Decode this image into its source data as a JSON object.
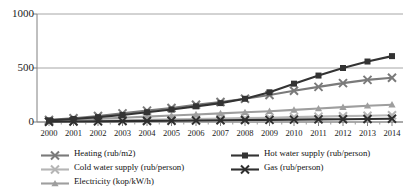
{
  "chart_data": {
    "type": "line",
    "title": "",
    "xlabel": "",
    "ylabel": "",
    "ylim": [
      0,
      1000
    ],
    "yticks": [
      0,
      500,
      1000
    ],
    "grid": true,
    "legend_position": "bottom",
    "categories": [
      "2000",
      "2001",
      "2002",
      "2003",
      "2004",
      "2005",
      "2006",
      "2007",
      "2008",
      "2009",
      "2010",
      "2011",
      "2012",
      "2013",
      "2014"
    ],
    "series": [
      {
        "name": "Heating (rub/m2)",
        "color": "#7a7a7a",
        "marker": "x",
        "values": [
          20,
          35,
          55,
          80,
          105,
          130,
          160,
          185,
          215,
          250,
          290,
          325,
          360,
          390,
          410
        ]
      },
      {
        "name": "Hot water supply (rub/person)",
        "color": "#333333",
        "marker": "square",
        "values": [
          15,
          28,
          45,
          65,
          90,
          115,
          145,
          175,
          215,
          275,
          355,
          430,
          500,
          560,
          610
        ]
      },
      {
        "name": "Cold water supply (rub/person)",
        "color": "#b5b5b5",
        "marker": "x",
        "values": [
          5,
          8,
          12,
          16,
          20,
          24,
          28,
          32,
          36,
          40,
          45,
          50,
          54,
          58,
          62
        ]
      },
      {
        "name": "Gas (rub/person)",
        "color": "#2e2e2e",
        "marker": "x",
        "values": [
          3,
          4,
          6,
          8,
          10,
          12,
          14,
          16,
          18,
          20,
          22,
          24,
          26,
          28,
          30
        ]
      },
      {
        "name": "Electricity (kop/kW/h)",
        "color": "#9e9e9e",
        "marker": "triangle",
        "values": [
          12,
          20,
          30,
          40,
          50,
          60,
          70,
          80,
          90,
          100,
          112,
          125,
          138,
          150,
          160
        ]
      }
    ]
  },
  "axis": {
    "y_labels": [
      "1000",
      "500",
      "0"
    ],
    "x_labels": [
      "2000",
      "2001",
      "2002",
      "2003",
      "2004",
      "2005",
      "2006",
      "2007",
      "2008",
      "2009",
      "2010",
      "2011",
      "2012",
      "2013",
      "2014"
    ]
  },
  "legend": {
    "column_left": [
      {
        "label": "Heating (rub/m2)",
        "series_index": 0
      },
      {
        "label": "Cold water supply (rub/person)",
        "series_index": 2
      },
      {
        "label": "Electricity (kop/kW/h)",
        "series_index": 4
      }
    ],
    "column_right": [
      {
        "label": "Hot water supply (rub/person)",
        "series_index": 1
      },
      {
        "label": "Gas (rub/person)",
        "series_index": 3
      }
    ]
  },
  "colors": {
    "axis": "#808080",
    "grid": "#a6a6a6",
    "text": "#111111",
    "background": "#ffffff"
  }
}
